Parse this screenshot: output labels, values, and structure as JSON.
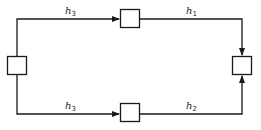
{
  "diagram": {
    "nodes": [
      {
        "id": "left",
        "x": 7,
        "y": 56,
        "w": 20,
        "h": 19
      },
      {
        "id": "top-middle",
        "x": 120,
        "y": 9,
        "w": 20,
        "h": 19
      },
      {
        "id": "bottom-middle",
        "x": 120,
        "y": 103,
        "w": 20,
        "h": 19
      },
      {
        "id": "right",
        "x": 232,
        "y": 56,
        "w": 20,
        "h": 19
      }
    ],
    "edges": [
      {
        "from": "left",
        "to": "top-middle",
        "label": "h",
        "sub": "3"
      },
      {
        "from": "top-middle",
        "to": "right",
        "label": "h",
        "sub": "1"
      },
      {
        "from": "left",
        "to": "bottom-middle",
        "label": "h",
        "sub": "3"
      },
      {
        "from": "bottom-middle",
        "to": "right",
        "label": "h",
        "sub": "2"
      }
    ],
    "labels": {
      "top_left": {
        "main": "h",
        "sub": "3"
      },
      "top_right": {
        "main": "h",
        "sub": "1"
      },
      "bottom_left": {
        "main": "h",
        "sub": "3"
      },
      "bottom_right": {
        "main": "h",
        "sub": "2"
      }
    },
    "colors": {
      "stroke": "#1a1a1a",
      "background": "#ffffff"
    }
  }
}
